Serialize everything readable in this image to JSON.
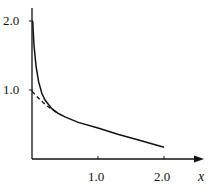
{
  "chart_data": {
    "type": "line",
    "title": "",
    "xlabel": "x",
    "ylabel": "",
    "xlim": [
      0,
      2.5
    ],
    "ylim": [
      0,
      2.1
    ],
    "grid": false,
    "legend": null,
    "x_ticks": [
      "1.0",
      "2.0"
    ],
    "y_ticks": [
      "1.0",
      "2.0"
    ],
    "series": [
      {
        "name": "solid curve",
        "style": "solid",
        "x": [
          0.01,
          0.03,
          0.06,
          0.1,
          0.15,
          0.2,
          0.3,
          0.4,
          0.5,
          0.7,
          1.0,
          1.3,
          1.6,
          2.0
        ],
        "y": [
          2.0,
          1.65,
          1.35,
          1.12,
          0.95,
          0.85,
          0.73,
          0.66,
          0.61,
          0.53,
          0.45,
          0.36,
          0.28,
          0.17
        ]
      },
      {
        "name": "dashed asymptote",
        "style": "dashed",
        "x": [
          0.0,
          0.1,
          0.2,
          0.3,
          0.4
        ],
        "y": [
          0.98,
          0.88,
          0.79,
          0.72,
          0.66
        ]
      }
    ]
  },
  "labels": {
    "y_tick_2": "2.0",
    "y_tick_1": "1.0",
    "x_tick_1": "1.0",
    "x_tick_2": "2.0",
    "x_axis": "x"
  }
}
